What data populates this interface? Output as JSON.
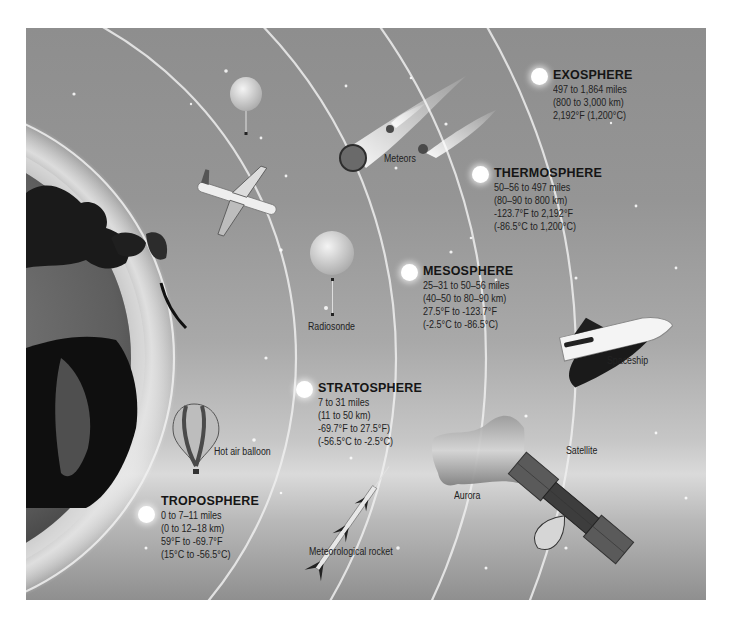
{
  "diagram": {
    "layers": [
      {
        "name": "EXOSPHERE",
        "lines": [
          "497 to 1,864 miles",
          "(800 to 3,000 km)",
          "2,192°F (1,200°C)"
        ]
      },
      {
        "name": "THERMOSPHERE",
        "lines": [
          "50–56 to 497 miles",
          "(80–90 to 800 km)",
          "-123.7°F to 2,192°F",
          "(-86.5°C to 1,200°C)"
        ]
      },
      {
        "name": "MESOSPHERE",
        "lines": [
          "25–31 to 50–56 miles",
          "(40–50 to 80–90 km)",
          "27.5°F to -123.7°F",
          "(-2.5°C to -86.5°C)"
        ]
      },
      {
        "name": "STRATOSPHERE",
        "lines": [
          "7 to 31 miles",
          "(11 to 50 km)",
          "-69.7°F to 27.5°F)",
          "(-56.5°C to -2.5°C)"
        ]
      },
      {
        "name": "TROPOSPHERE",
        "lines": [
          "0 to 7–11 miles",
          "(0 to 12–18 km)",
          "59°F to -69.7°F",
          "(15°C to -56.5°C)"
        ]
      }
    ],
    "objects": {
      "meteors": "Meteors",
      "radiosonde": "Radiosonde",
      "spaceship": "Spaceship",
      "hot_air_balloon": "Hot air balloon",
      "satellite": "Satellite",
      "aurora": "Aurora",
      "meteorological_rocket": "Meteorological rocket"
    }
  }
}
